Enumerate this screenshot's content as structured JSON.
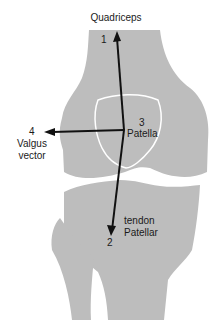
{
  "title": "Quadriceps",
  "labels": {
    "n1": "1",
    "n2": "2",
    "n3": "3",
    "n4": "4",
    "patella": "Patella",
    "valgus_line1": "Valgus",
    "valgus_line2": "vector",
    "tendon_line1": "tendon",
    "tendon_line2": "Patellar"
  },
  "colors": {
    "bone": "#bdbdbd",
    "outline": "#ffffff",
    "arrow": "#111111",
    "background": "#ffffff"
  }
}
